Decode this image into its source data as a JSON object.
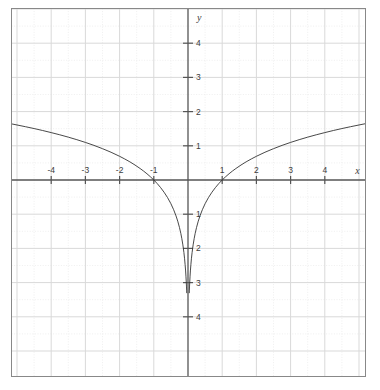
{
  "chart_data": {
    "type": "line",
    "title": "",
    "subtitle": "",
    "xlabel": "x",
    "ylabel": "y",
    "function": "y = ln|x|",
    "xlim": [
      -5.2,
      5.2
    ],
    "ylim": [
      -5.0,
      5.0
    ],
    "grid": true,
    "grid_major_step": 1,
    "grid_minor_step": 0.5,
    "legend": null,
    "x_tick_values": [
      -4,
      -3,
      -2,
      -1,
      1,
      2,
      3,
      4
    ],
    "x_tick_labels": [
      "-4",
      "-3",
      "-2",
      "-1",
      "1",
      "2",
      "3",
      "4"
    ],
    "y_tick_values": [
      4,
      3,
      2,
      1,
      -1,
      -2,
      -3,
      -4
    ],
    "y_tick_labels": [
      "4",
      "3",
      "2",
      "1",
      "1",
      "2",
      "3",
      "4"
    ],
    "series": [
      {
        "name": "y = ln|x| (x < 0)",
        "branch": "left",
        "points": [
          [
            -5.2,
            1.649
          ],
          [
            -5.0,
            1.609
          ],
          [
            -4.75,
            1.558
          ],
          [
            -4.5,
            1.504
          ],
          [
            -4.25,
            1.447
          ],
          [
            -4.0,
            1.386
          ],
          [
            -3.75,
            1.322
          ],
          [
            -3.5,
            1.253
          ],
          [
            -3.25,
            1.179
          ],
          [
            -3.0,
            1.099
          ],
          [
            -2.75,
            1.012
          ],
          [
            -2.5,
            0.916
          ],
          [
            -2.25,
            0.811
          ],
          [
            -2.0,
            0.693
          ],
          [
            -1.85,
            0.615
          ],
          [
            -1.7,
            0.531
          ],
          [
            -1.55,
            0.438
          ],
          [
            -1.4,
            0.336
          ],
          [
            -1.3,
            0.262
          ],
          [
            -1.2,
            0.182
          ],
          [
            -1.1,
            0.095
          ],
          [
            -1.0,
            0.0
          ],
          [
            -0.9,
            -0.105
          ],
          [
            -0.8,
            -0.223
          ],
          [
            -0.7,
            -0.357
          ],
          [
            -0.6,
            -0.511
          ],
          [
            -0.5,
            -0.693
          ],
          [
            -0.42,
            -0.868
          ],
          [
            -0.35,
            -1.05
          ],
          [
            -0.3,
            -1.204
          ],
          [
            -0.25,
            -1.386
          ],
          [
            -0.21,
            -1.561
          ],
          [
            -0.18,
            -1.715
          ],
          [
            -0.15,
            -1.897
          ],
          [
            -0.12,
            -2.12
          ],
          [
            -0.1,
            -2.303
          ],
          [
            -0.085,
            -2.465
          ],
          [
            -0.07,
            -2.659
          ],
          [
            -0.06,
            -2.813
          ],
          [
            -0.05,
            -2.996
          ],
          [
            -0.045,
            -3.101
          ],
          [
            -0.04,
            -3.219
          ],
          [
            -0.037,
            -3.297
          ]
        ]
      },
      {
        "name": "y = ln|x| (x > 0)",
        "branch": "right",
        "points": [
          [
            0.037,
            -3.297
          ],
          [
            0.04,
            -3.219
          ],
          [
            0.045,
            -3.101
          ],
          [
            0.05,
            -2.996
          ],
          [
            0.06,
            -2.813
          ],
          [
            0.07,
            -2.659
          ],
          [
            0.085,
            -2.465
          ],
          [
            0.1,
            -2.303
          ],
          [
            0.12,
            -2.12
          ],
          [
            0.15,
            -1.897
          ],
          [
            0.18,
            -1.715
          ],
          [
            0.21,
            -1.561
          ],
          [
            0.25,
            -1.386
          ],
          [
            0.3,
            -1.204
          ],
          [
            0.35,
            -1.05
          ],
          [
            0.42,
            -0.868
          ],
          [
            0.5,
            -0.693
          ],
          [
            0.6,
            -0.511
          ],
          [
            0.7,
            -0.357
          ],
          [
            0.8,
            -0.223
          ],
          [
            0.9,
            -0.105
          ],
          [
            1.0,
            0.0
          ],
          [
            1.1,
            0.095
          ],
          [
            1.2,
            0.182
          ],
          [
            1.3,
            0.262
          ],
          [
            1.4,
            0.336
          ],
          [
            1.55,
            0.438
          ],
          [
            1.7,
            0.531
          ],
          [
            1.85,
            0.615
          ],
          [
            2.0,
            0.693
          ],
          [
            2.25,
            0.811
          ],
          [
            2.5,
            0.916
          ],
          [
            2.75,
            1.012
          ],
          [
            3.0,
            1.099
          ],
          [
            3.25,
            1.179
          ],
          [
            3.5,
            1.253
          ],
          [
            3.75,
            1.322
          ],
          [
            4.0,
            1.386
          ],
          [
            4.25,
            1.447
          ],
          [
            4.5,
            1.504
          ],
          [
            4.75,
            1.558
          ],
          [
            5.0,
            1.609
          ],
          [
            5.2,
            1.649
          ]
        ]
      }
    ],
    "colors": {
      "curve": "#333333",
      "axis": "#555555",
      "grid_major": "#d9d9d9",
      "grid_minor": "#ebebeb",
      "frame": "#888888",
      "background": "#ffffff",
      "tick_text": "#3c3c3c"
    }
  }
}
